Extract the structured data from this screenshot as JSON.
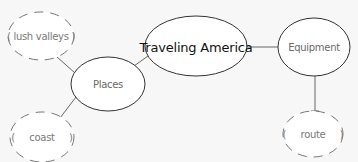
{
  "diagram": {
    "type": "mind-map",
    "colors": {
      "background": "#f7f7f7",
      "line": "#666666",
      "central_text": "#111111",
      "topic_text": "#6a6a6a",
      "leaf_text": "#7a7a7a",
      "node_fill": "#ffffff"
    },
    "nodes": {
      "central": {
        "label": "Traveling America",
        "cx": 196,
        "cy": 46,
        "rx": 51,
        "ry": 30
      },
      "places": {
        "label": "Places",
        "cx": 108,
        "cy": 84,
        "rx": 37,
        "ry": 27
      },
      "equipment": {
        "label": "Equipment",
        "cx": 314,
        "cy": 47,
        "rx": 36,
        "ry": 29
      },
      "lush_valleys": {
        "label": "( lush valleys )",
        "cx": 41,
        "cy": 36,
        "rx": 33,
        "ry": 24
      },
      "coast": {
        "label": "(     coast     )",
        "cx": 42,
        "cy": 137,
        "rx": 32,
        "ry": 25
      },
      "route": {
        "label": "(     route     )",
        "cx": 313,
        "cy": 134,
        "rx": 30,
        "ry": 23
      }
    },
    "edges": [
      {
        "from": "central",
        "to": "places"
      },
      {
        "from": "central",
        "to": "equipment"
      },
      {
        "from": "places",
        "to": "lush_valleys"
      },
      {
        "from": "places",
        "to": "coast"
      },
      {
        "from": "equipment",
        "to": "route"
      }
    ]
  }
}
